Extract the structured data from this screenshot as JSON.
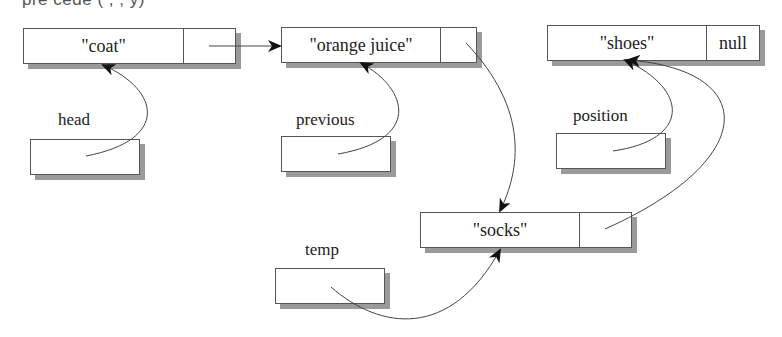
{
  "caption_fragment": "pre   cede     (   ,      ,       y)",
  "nodes": [
    {
      "id": "coat",
      "value": "\"coat\"",
      "next": ""
    },
    {
      "id": "orange-juice",
      "value": "\"orange juice\"",
      "next": ""
    },
    {
      "id": "shoes",
      "value": "\"shoes\"",
      "next": "null"
    },
    {
      "id": "socks",
      "value": "\"socks\"",
      "next": ""
    }
  ],
  "pointers": [
    {
      "id": "head",
      "label": "head",
      "points_to": "coat"
    },
    {
      "id": "previous",
      "label": "previous",
      "points_to": "orange-juice"
    },
    {
      "id": "position",
      "label": "position",
      "points_to": "shoes"
    },
    {
      "id": "temp",
      "label": "temp",
      "points_to": "socks"
    }
  ],
  "links": [
    {
      "from": "coat",
      "to": "orange-juice"
    },
    {
      "from": "orange-juice",
      "to": "socks"
    },
    {
      "from": "socks",
      "to": "shoes"
    }
  ],
  "colors": {
    "line": "#555555",
    "shadow": "#9a9a9a",
    "arrow": "#111111"
  }
}
